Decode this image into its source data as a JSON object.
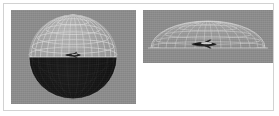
{
  "figure": {
    "domain": "Diagram",
    "caption": "",
    "background_color": "#ffffff",
    "frame_border_color": "#d2d2d2",
    "panel_background_color": "#8e8e8e",
    "width_px": 279,
    "height_px": 116
  },
  "panels": [
    {
      "id": "sphere",
      "name": "wireframe-sphere-view",
      "label": "",
      "view": "oblique",
      "background_color": "#8e8e8e",
      "geometry": {
        "shape": "sphere",
        "upper_hemisphere_style": "wireframe",
        "upper_hemisphere_color": "#c9c9c9",
        "lower_hemisphere_style": "solid",
        "lower_hemisphere_color": "#141414",
        "meridian_count": 12,
        "parallel_count": 5,
        "equator_visible": true,
        "center_object": "aircraft"
      }
    },
    {
      "id": "dome",
      "name": "wireframe-dome-side-view",
      "label": "",
      "view": "edge-on",
      "background_color": "#8e8e8e",
      "geometry": {
        "shape": "dome",
        "style": "wireframe",
        "wire_color": "#cccccc",
        "meridian_count": 12,
        "parallel_count": 4,
        "horizon_line_visible": true,
        "center_object": "aircraft"
      }
    }
  ],
  "objects": {
    "aircraft": {
      "name": "aircraft-silhouette",
      "color": "#2a2a2a",
      "highlight_color": "#e8e8e8"
    }
  }
}
